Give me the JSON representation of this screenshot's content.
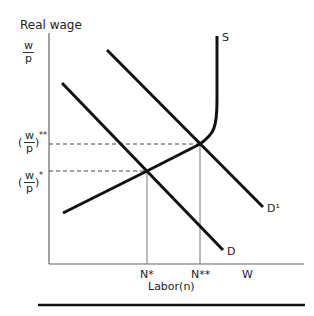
{
  "diagram": {
    "y_axis_title": "Real wage",
    "y_axis_unit": {
      "num": "w",
      "den": "p"
    },
    "x_axis_title": "Labor(n)",
    "y_ticks": [
      {
        "num": "w",
        "den": "p",
        "sup": "**",
        "label": "(w/p)**"
      },
      {
        "num": "w",
        "den": "p",
        "sup": "*",
        "label": "(w/p)*"
      }
    ],
    "x_ticks": [
      "N*",
      "N**",
      "W"
    ],
    "curves": {
      "supply": "S",
      "demand": "D",
      "demand_shifted": "D¹"
    },
    "paren_open": "(",
    "paren_close": ")",
    "line_color": "#111111",
    "axis_color": "#555555"
  }
}
